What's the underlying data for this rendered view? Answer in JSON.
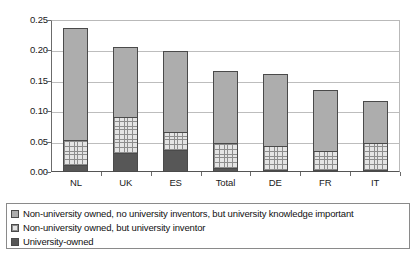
{
  "chart_data": {
    "type": "bar",
    "subtype": "stacked-vertical",
    "title": "",
    "xlabel": "",
    "ylabel": "",
    "ylim": [
      0.0,
      0.25
    ],
    "ytick_labels": [
      "0.25",
      "0.20",
      "0.15",
      "0.10",
      "0.05",
      "0.00"
    ],
    "ytick_values": [
      0.25,
      0.2,
      0.15,
      0.1,
      0.05,
      0.0
    ],
    "grid": true,
    "legend_position": "bottom",
    "categories": [
      "NL",
      "UK",
      "ES",
      "Total",
      "DE",
      "FR",
      "IT"
    ],
    "series": [
      {
        "name": "University-owned",
        "key": "owned",
        "color": "#575757",
        "pattern": "solid-dark",
        "values": [
          0.011,
          0.031,
          0.037,
          0.006,
          0.002,
          0.003,
          0.001
        ]
      },
      {
        "name": "Non-university owned, but university inventor",
        "key": "inventor",
        "color": "#e4e4e4",
        "pattern": "cross-hatch",
        "values": [
          0.041,
          0.06,
          0.029,
          0.041,
          0.04,
          0.031,
          0.044
        ]
      },
      {
        "name": "Non-university owned, no university inventors, but university knowledge important",
        "key": "knowledge",
        "color": "#adadad",
        "pattern": "solid-grey",
        "values": [
          0.185,
          0.114,
          0.133,
          0.119,
          0.118,
          0.1,
          0.069
        ]
      }
    ],
    "totals": [
      0.237,
      0.205,
      0.199,
      0.166,
      0.16,
      0.134,
      0.114
    ]
  },
  "legend": {
    "items": [
      {
        "label": "Non-university owned, no university inventors, but university knowledge important",
        "key": "knowledge"
      },
      {
        "label": "Non-university owned, but university inventor",
        "key": "inventor"
      },
      {
        "label": "University-owned",
        "key": "owned"
      }
    ]
  }
}
